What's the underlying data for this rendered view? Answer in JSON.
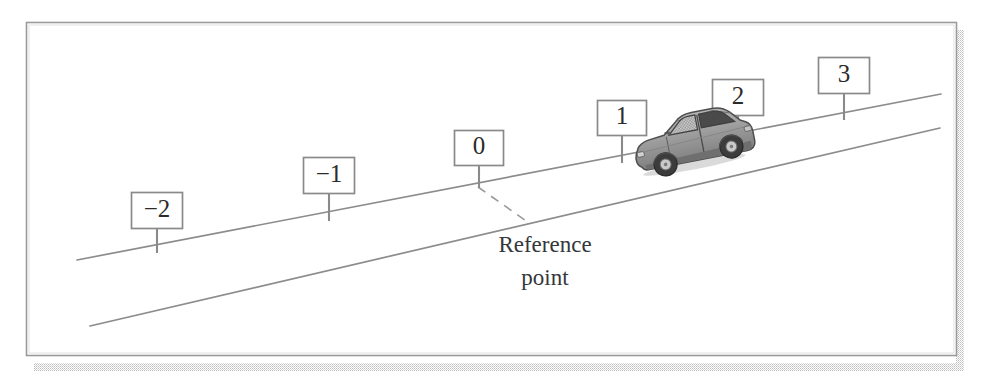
{
  "figure": {
    "name": "inclined-road-reference-point-diagram",
    "background_color": "#ffffff",
    "frame": {
      "border_color": "#9a9a9a",
      "shadow_color": "#c9c9c9",
      "x": 26,
      "y": 22,
      "width": 930,
      "height": 333
    },
    "road": {
      "line_color": "#8c8c8c",
      "upper_line": {
        "x1": 77,
        "y1": 260,
        "x2": 941,
        "y2": 94
      },
      "lower_line": {
        "x1": 90,
        "y1": 326,
        "x2": 940,
        "y2": 128
      }
    },
    "reference_marker": {
      "label": "Reference\npoint",
      "caption_line1": "Reference",
      "caption_line2": "point",
      "dashed_line": {
        "x1": 478,
        "y1": 186,
        "x2": 528,
        "y2": 222
      },
      "dash_color": "#9a9a9a"
    },
    "signs": [
      {
        "label": "-2",
        "display": "−2",
        "box_x": 131,
        "box_y": 192,
        "box_w": 52,
        "box_h": 37,
        "post_bottom_y": 253
      },
      {
        "label": "-1",
        "display": "−1",
        "box_x": 303,
        "box_y": 157,
        "box_w": 52,
        "box_h": 37,
        "post_bottom_y": 221
      },
      {
        "label": "0",
        "display": "0",
        "box_x": 454,
        "box_y": 130,
        "box_w": 50,
        "box_h": 36,
        "post_bottom_y": 188
      },
      {
        "label": "1",
        "display": "1",
        "box_x": 597,
        "box_y": 100,
        "box_w": 50,
        "box_h": 36,
        "post_bottom_y": 163
      },
      {
        "label": "2",
        "display": "2",
        "box_x": 712,
        "box_y": 79,
        "box_w": 52,
        "box_h": 37,
        "post_bottom_y": 141
      },
      {
        "label": "3",
        "display": "3",
        "box_x": 818,
        "box_y": 57,
        "box_w": 52,
        "box_h": 37,
        "post_bottom_y": 120
      }
    ],
    "sign_style": {
      "box_fill": "#ffffff",
      "box_stroke": "#8a8a8a",
      "post_color": "#8a8a8a",
      "text_color": "#2b2b2b"
    },
    "car": {
      "name": "car-on-incline",
      "description": "gray hatchback car facing uphill to the right",
      "body_color": "#9b9b9b",
      "window_color": "#4a4a4a",
      "tire_color": "#3c3c3c",
      "outline_color": "#4d4d4d",
      "x": 627,
      "y": 123,
      "width": 118,
      "height": 60,
      "rotation_deg": -11
    }
  }
}
